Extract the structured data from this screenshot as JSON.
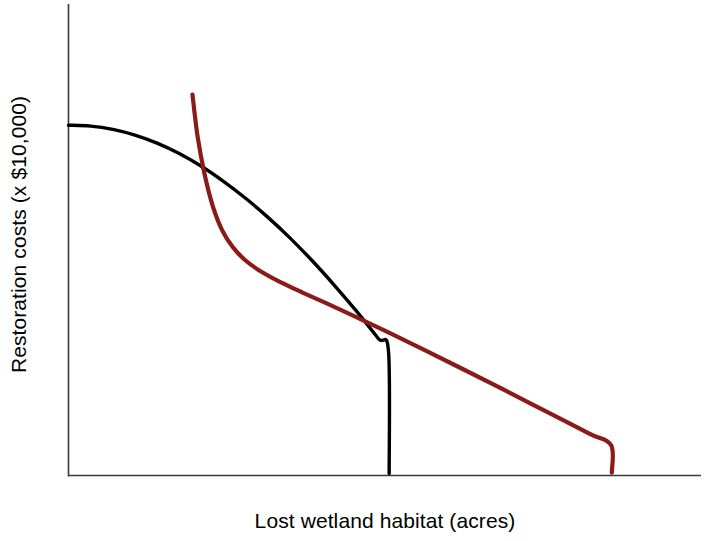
{
  "chart_data": {
    "type": "line",
    "title": "",
    "subtitle": "",
    "xlabel": "Lost wetland habitat (acres)",
    "ylabel": "Restoration costs (x $10,000)",
    "xlim": [
      0,
      100
    ],
    "ylim": [
      0,
      100
    ],
    "grid": false,
    "legend": "none",
    "axis_ticks": {
      "x": [],
      "y": []
    },
    "annotations": [],
    "series": [
      {
        "name": "marginal-benefit-curve",
        "color": "#000000",
        "shape": "concave-down decreasing",
        "linewidth": 3.4,
        "points": [
          {
            "x": 0.0,
            "y": 74.3
          },
          {
            "x": 3.5,
            "y": 74.1
          },
          {
            "x": 7.0,
            "y": 73.4
          },
          {
            "x": 10.5,
            "y": 72.2
          },
          {
            "x": 14.0,
            "y": 70.5
          },
          {
            "x": 17.5,
            "y": 68.3
          },
          {
            "x": 21.0,
            "y": 65.6
          },
          {
            "x": 24.5,
            "y": 62.4
          },
          {
            "x": 28.0,
            "y": 58.8
          },
          {
            "x": 31.5,
            "y": 54.8
          },
          {
            "x": 35.0,
            "y": 50.4
          },
          {
            "x": 38.5,
            "y": 45.6
          },
          {
            "x": 42.0,
            "y": 40.4
          },
          {
            "x": 45.5,
            "y": 34.9
          },
          {
            "x": 49.0,
            "y": 29.0
          },
          {
            "x": 50.6,
            "y": 26.2
          },
          {
            "x": 50.7,
            "y": 0.4
          }
        ]
      },
      {
        "name": "marginal-cost-curve",
        "color": "#8B1A1A",
        "shape": "convex decreasing",
        "linewidth": 4.2,
        "points": [
          {
            "x": 19.6,
            "y": 80.8
          },
          {
            "x": 20.4,
            "y": 72.0
          },
          {
            "x": 21.5,
            "y": 64.0
          },
          {
            "x": 22.8,
            "y": 57.2
          },
          {
            "x": 24.3,
            "y": 52.0
          },
          {
            "x": 26.0,
            "y": 48.4
          },
          {
            "x": 28.0,
            "y": 45.6
          },
          {
            "x": 30.5,
            "y": 43.2
          },
          {
            "x": 33.5,
            "y": 41.0
          },
          {
            "x": 37.0,
            "y": 38.8
          },
          {
            "x": 41.0,
            "y": 36.4
          },
          {
            "x": 45.5,
            "y": 33.6
          },
          {
            "x": 50.5,
            "y": 30.4
          },
          {
            "x": 56.0,
            "y": 26.8
          },
          {
            "x": 62.0,
            "y": 22.8
          },
          {
            "x": 68.5,
            "y": 18.4
          },
          {
            "x": 75.5,
            "y": 13.6
          },
          {
            "x": 82.5,
            "y": 8.8
          },
          {
            "x": 85.8,
            "y": 6.4
          },
          {
            "x": 85.9,
            "y": 0.6
          }
        ]
      }
    ],
    "axes_style": {
      "color": "#3a3a3a",
      "spines": [
        "left",
        "bottom"
      ],
      "linewidth": 1.6
    }
  }
}
